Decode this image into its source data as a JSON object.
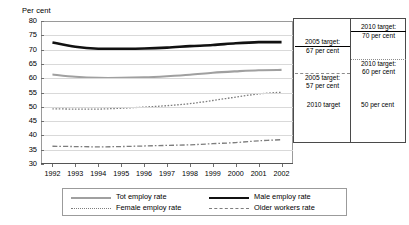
{
  "axis_title": "Per cent",
  "chart_data": {
    "type": "line",
    "title": "",
    "xlabel": "",
    "ylabel": "Per cent",
    "ylim": [
      30,
      80
    ],
    "ytick_step": 5,
    "grid": true,
    "legend_position": "bottom",
    "yticks": [
      "80",
      "75",
      "70",
      "65",
      "60",
      "55",
      "50",
      "45",
      "40",
      "35",
      "30"
    ],
    "categories": [
      "1992",
      "1993",
      "1994",
      "1995",
      "1996",
      "1997",
      "1998",
      "1999",
      "2000",
      "2001",
      "2002"
    ],
    "series": [
      {
        "name": "Tot employ rate",
        "style": "solid-grey",
        "color": "#a0a0a0",
        "values": [
          61.3,
          60.5,
          60.1,
          60.1,
          60.3,
          60.7,
          61.2,
          61.9,
          62.4,
          62.8,
          62.9
        ]
      },
      {
        "name": "Male employ rate",
        "style": "solid-black",
        "color": "#111111",
        "values": [
          72.5,
          71.0,
          70.3,
          70.3,
          70.4,
          70.7,
          71.2,
          71.6,
          72.2,
          72.6,
          72.6
        ]
      },
      {
        "name": "Female employ rate",
        "style": "dotted",
        "color": "#7d7d7d",
        "values": [
          49.3,
          49.2,
          49.2,
          49.5,
          49.9,
          50.4,
          51.1,
          52.2,
          53.4,
          54.5,
          55.1
        ]
      },
      {
        "name": "Older workers rate",
        "style": "dash-dot",
        "color": "#7d7d7d",
        "values": [
          36.2,
          36.1,
          36.0,
          36.1,
          36.3,
          36.5,
          36.7,
          37.1,
          37.5,
          38.1,
          38.5
        ]
      }
    ],
    "annotations": [
      {
        "id": "target-2005-67",
        "line1": "2005 target:",
        "line2": "67 per cent",
        "value": 67,
        "rule": "black"
      },
      {
        "id": "target-2010-70",
        "line1": "2010 target:",
        "line2": "70 per cent",
        "value": 70,
        "rule": "black"
      },
      {
        "id": "target-2005-57",
        "line1": "2005 target:",
        "line2": "57 per cent",
        "value": 57,
        "rule": "grey-dash"
      },
      {
        "id": "target-2010-60",
        "line1": "2010 target:",
        "line2": "60 per cent",
        "value": 60,
        "rule": "grey-dot"
      },
      {
        "id": "target-2010-50",
        "line1": "2010 target",
        "line2": "50 per cent",
        "value": 50,
        "rule": "grey-dash"
      }
    ]
  },
  "legend": {
    "items": [
      {
        "label": "Tot employ rate",
        "key": "tot"
      },
      {
        "label": "Male employ rate",
        "key": "male"
      },
      {
        "label": "Female employ rate",
        "key": "female"
      },
      {
        "label": "Older workers rate",
        "key": "older"
      }
    ]
  }
}
